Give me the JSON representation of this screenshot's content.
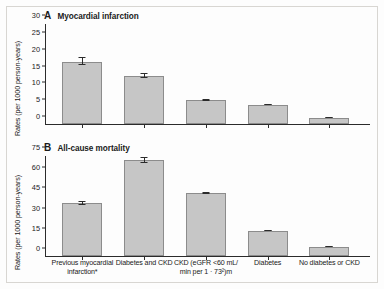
{
  "figure": {
    "ylabel": "Rates (per 1000 person-years)",
    "categories": [
      "Previous myocardial infarction*",
      "Diabetes and CKD",
      "CKD (eGFR <60 mL/min per 1·73²)m",
      "Diabetes",
      "No diabetes or CKD"
    ]
  },
  "chart_data": [
    {
      "type": "bar",
      "panel": "A",
      "title": "Myocardial infarction",
      "categories": [
        "Previous myocardial infarction*",
        "Diabetes and CKD",
        "CKD (eGFR <60 mL/min per 1·73²)m",
        "Diabetes",
        "No diabetes or CKD"
      ],
      "values": [
        18.5,
        14.3,
        7.1,
        5.7,
        1.8
      ],
      "errors_low": [
        17.4,
        13.6,
        6.9,
        5.5,
        1.75
      ],
      "errors_high": [
        19.8,
        15.1,
        7.3,
        5.9,
        1.9
      ],
      "xlabel": "",
      "ylabel": "Rates (per 1000 person-years)",
      "ylim": [
        0,
        30
      ],
      "yticks": [
        0,
        5,
        10,
        15,
        20,
        25,
        30
      ],
      "grid": false,
      "legend": false
    },
    {
      "type": "bar",
      "panel": "B",
      "title": "All-cause mortality",
      "categories": [
        "Previous myocardial infarction*",
        "Diabetes and CKD",
        "CKD (eGFR <60 mL/min per 1·73²)m",
        "Diabetes",
        "No diabetes or CKD"
      ],
      "values": [
        39.0,
        71.5,
        46.5,
        18.8,
        6.8
      ],
      "errors_low": [
        37.6,
        69.3,
        45.9,
        18.4,
        6.6
      ],
      "errors_high": [
        40.6,
        73.8,
        47.2,
        19.3,
        7.0
      ],
      "xlabel": "",
      "ylabel": "Rates (per 1000 person-years)",
      "ylim": [
        0,
        75
      ],
      "yticks": [
        0,
        15,
        30,
        45,
        60,
        75
      ],
      "grid": false,
      "legend": false
    }
  ],
  "panel_a": {
    "letter": "A",
    "title": "Myocardial infarction",
    "ylabel": "Rates (per 1000 person-years)",
    "yticks": [
      "30",
      "25",
      "20",
      "15",
      "10",
      "5",
      "0"
    ]
  },
  "panel_b": {
    "letter": "B",
    "title": "All-cause mortality",
    "ylabel": "Rates (per 1000 person-years)",
    "yticks": [
      "75",
      "60",
      "45",
      "30",
      "15",
      "0"
    ]
  },
  "xlabels": [
    {
      "line1": "Previous myocardial",
      "line2": "infarction*"
    },
    {
      "line1": "Diabetes and CKD",
      "line2": ""
    },
    {
      "line1": "CKD (eGFR <60 mL/",
      "line2": "min per 1 · 73²)m"
    },
    {
      "line1": "Diabetes",
      "line2": ""
    },
    {
      "line1": "No diabetes or CKD",
      "line2": ""
    }
  ],
  "colors": {
    "bar_fill": "#c6c6c6",
    "bar_stroke": "#8c8c8c",
    "axis": "#2b2b2b",
    "frame": "#d8d6d2"
  }
}
